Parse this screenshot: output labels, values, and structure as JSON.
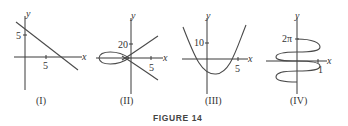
{
  "figure": {
    "caption": "FIGURE 14",
    "panels": [
      {
        "id": "I",
        "label": "(I)",
        "x_axis": "x",
        "y_axis": "y",
        "x_tick": "5",
        "y_tick": "5",
        "curve": "decreasing line"
      },
      {
        "id": "II",
        "label": "(II)",
        "x_axis": "x",
        "y_axis": "y",
        "x_tick": "5",
        "y_tick": "20",
        "curve": "loop crossing origin with two branches"
      },
      {
        "id": "III",
        "label": "(III)",
        "x_axis": "x",
        "y_axis": "y",
        "x_tick": "5",
        "y_tick": "10",
        "curve": "upward parabola"
      },
      {
        "id": "IV",
        "label": "(IV)",
        "x_axis": "x",
        "y_axis": "y",
        "x_tick": "1",
        "y_tick": "2π",
        "curve": "sinusoid along y-axis"
      }
    ]
  }
}
